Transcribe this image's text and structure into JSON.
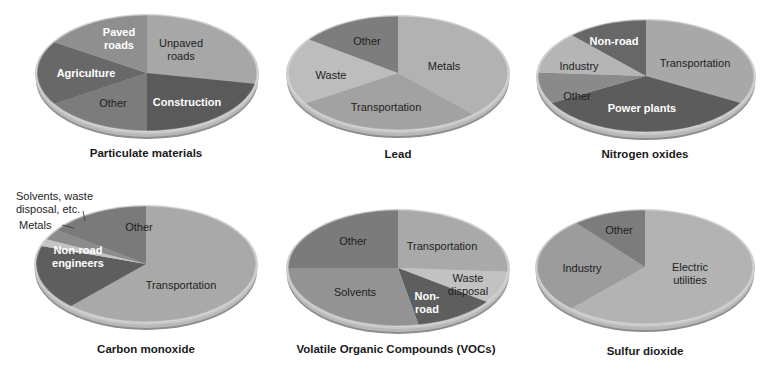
{
  "chart_data": [
    {
      "type": "pie",
      "title": "Particulate materials",
      "slices": [
        {
          "label": "Unpaved roads",
          "value": 28,
          "color": "#a7a7a7",
          "text": "dark"
        },
        {
          "label": "Construction",
          "value": 22,
          "color": "#5a5a5a",
          "text": "light"
        },
        {
          "label": "Other",
          "value": 16,
          "color": "#7c7c7c",
          "text": "dark"
        },
        {
          "label": "Agriculture",
          "value": 18,
          "color": "#686868",
          "text": "light"
        },
        {
          "label": "Paved roads",
          "value": 16,
          "color": "#8f8f8f",
          "text": "light"
        }
      ]
    },
    {
      "type": "pie",
      "title": "Lead",
      "slices": [
        {
          "label": "Metals",
          "value": 38,
          "color": "#b2b2b2",
          "text": "dark"
        },
        {
          "label": "Transportation",
          "value": 28,
          "color": "#a2a2a2",
          "text": "dark"
        },
        {
          "label": "Waste",
          "value": 19,
          "color": "#bdbdbd",
          "text": "dark"
        },
        {
          "label": "Other",
          "value": 15,
          "color": "#7d7d7d",
          "text": "dark"
        }
      ]
    },
    {
      "type": "pie",
      "title": "Nitrogen oxides",
      "slices": [
        {
          "label": "Transportation",
          "value": 33,
          "color": "#a8a8a8",
          "text": "dark"
        },
        {
          "label": "Power plants",
          "value": 34,
          "color": "#5c5c5c",
          "text": "light"
        },
        {
          "label": "Other",
          "value": 9,
          "color": "#8a8a8a",
          "text": "dark"
        },
        {
          "label": "Industry",
          "value": 12,
          "color": "#b5b5b5",
          "text": "dark"
        },
        {
          "label": "Non-road",
          "value": 12,
          "color": "#676767",
          "text": "light"
        }
      ]
    },
    {
      "type": "pie",
      "title": "Carbon monoxide",
      "slices": [
        {
          "label": "Transportation",
          "value": 62,
          "color": "#a9a9a9",
          "text": "dark"
        },
        {
          "label": "Non-road engineers",
          "value": 18,
          "color": "#5e5e5e",
          "text": "light"
        },
        {
          "label": "Metals",
          "value": 2,
          "color": "#c4c4c4",
          "text": "dark"
        },
        {
          "label": "Solvents, waste disposal, etc.",
          "value": 3,
          "color": "#8c8c8c",
          "text": "dark"
        },
        {
          "label": "Other",
          "value": 15,
          "color": "#7a7a7a",
          "text": "dark"
        }
      ]
    },
    {
      "type": "pie",
      "title": "Volatile Organic Compounds (VOCs)",
      "slices": [
        {
          "label": "Transportation",
          "value": 26,
          "color": "#a9a9a9",
          "text": "dark"
        },
        {
          "label": "Waste disposal",
          "value": 9,
          "color": "#c2c2c2",
          "text": "dark"
        },
        {
          "label": "Non-road",
          "value": 12,
          "color": "#5e5e5e",
          "text": "light"
        },
        {
          "label": "Solvents",
          "value": 28,
          "color": "#939393",
          "text": "dark"
        },
        {
          "label": "Other",
          "value": 25,
          "color": "#7b7b7b",
          "text": "dark"
        }
      ]
    },
    {
      "type": "pie",
      "title": "Sulfur dioxide",
      "slices": [
        {
          "label": "Electric utilities",
          "value": 62,
          "color": "#b3b3b3",
          "text": "dark"
        },
        {
          "label": "Industry",
          "value": 27,
          "color": "#9c9c9c",
          "text": "dark"
        },
        {
          "label": "Other",
          "value": 11,
          "color": "#7c7c7c",
          "text": "dark"
        }
      ]
    }
  ],
  "labels": {
    "pm": {
      "paved": "Paved\nroads",
      "unpaved": "Unpaved\nroads",
      "agriculture": "Agriculture",
      "other": "Other",
      "construction": "Construction",
      "title": "Particulate materials"
    },
    "lead": {
      "other": "Other",
      "metals": "Metals",
      "waste": "Waste",
      "transportation": "Transportation",
      "title": "Lead"
    },
    "nox": {
      "nonroad": "Non-road",
      "industry": "Industry",
      "transportation": "Transportation",
      "other": "Other",
      "power": "Power plants",
      "title": "Nitrogen oxides"
    },
    "co": {
      "solvents": "Solvents, waste\ndisposal, etc.",
      "metals": "Metals",
      "other": "Other",
      "nonroad": "Non-road\nengineers",
      "transportation": "Transportation",
      "title": "Carbon monoxide"
    },
    "voc": {
      "other": "Other",
      "transportation": "Transportation",
      "waste": "Waste\ndisposal",
      "solvents": "Solvents",
      "nonroad": "Non-\nroad",
      "title": "Volatile Organic Compounds (VOCs)"
    },
    "so2": {
      "other": "Other",
      "industry": "Industry",
      "electric": "Electric\nutilities",
      "title": "Sulfur dioxide"
    }
  }
}
